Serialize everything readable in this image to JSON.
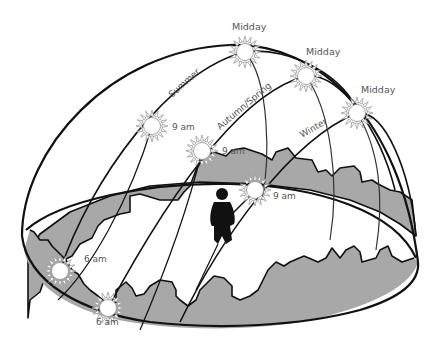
{
  "diagram": {
    "type": "sun-path-dome",
    "colors": {
      "background": "#ffffff",
      "outline": "#111111",
      "landscape_fill": "#a8a8a8",
      "sun_fill": "#ffffff",
      "sun_rays": "#9a9a9a",
      "label": "#555555",
      "person": "#111111"
    },
    "paths": [
      {
        "season": "Summer",
        "label": "Summer"
      },
      {
        "season": "Autumn/Spring",
        "label": "Autumn/Spring"
      },
      {
        "season": "Winter",
        "label": "Winter"
      }
    ],
    "suns": [
      {
        "id": "midday-summer",
        "label": "Midday"
      },
      {
        "id": "midday-autumn-spring",
        "label": "Midday"
      },
      {
        "id": "midday-winter",
        "label": "Midday"
      },
      {
        "id": "9am-summer",
        "label": "9 am"
      },
      {
        "id": "9am-autumn-spring",
        "label": "9 am"
      },
      {
        "id": "9am-winter",
        "label": "9 am"
      },
      {
        "id": "6am-summer",
        "label": "6 am"
      },
      {
        "id": "6am-autumn-spring",
        "label": "6 am"
      }
    ],
    "observer": "person-silhouette"
  }
}
